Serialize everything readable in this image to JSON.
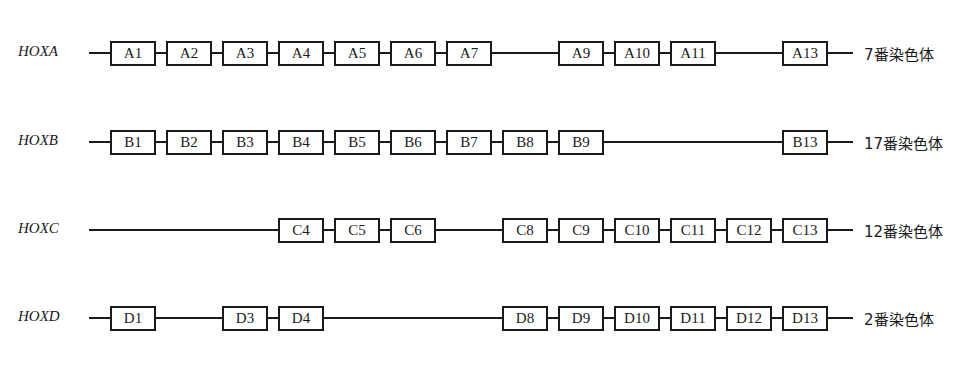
{
  "diagram": {
    "rows": [
      {
        "name": "HOXA",
        "chromosome": "7番染色体",
        "genes": [
          "A1",
          "A2",
          "A3",
          "A4",
          "A5",
          "A6",
          "A7",
          "",
          "A9",
          "A10",
          "A11",
          "",
          "A13"
        ]
      },
      {
        "name": "HOXB",
        "chromosome": "17番染色体",
        "genes": [
          "B1",
          "B2",
          "B3",
          "B4",
          "B5",
          "B6",
          "B7",
          "B8",
          "B9",
          "",
          "",
          "",
          "B13"
        ]
      },
      {
        "name": "HOXC",
        "chromosome": "12番染色体",
        "genes": [
          "",
          "",
          "",
          "C4",
          "C5",
          "C6",
          "",
          "C8",
          "C9",
          "C10",
          "C11",
          "C12",
          "C13"
        ]
      },
      {
        "name": "HOXD",
        "chromosome": "2番染色体",
        "genes": [
          "D1",
          "",
          "D3",
          "D4",
          "",
          "",
          "",
          "D8",
          "D9",
          "D10",
          "D11",
          "D12",
          "D13"
        ]
      }
    ]
  }
}
